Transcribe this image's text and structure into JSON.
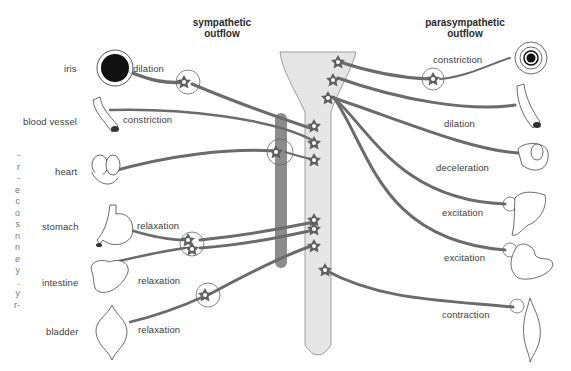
{
  "headers": {
    "sympathetic": [
      "sympathetic",
      "outflow"
    ],
    "parasympathetic": [
      "parasympathetic",
      "outflow"
    ]
  },
  "organs_left": [
    {
      "name": "iris",
      "effect": "dilation"
    },
    {
      "name": "blood vessel",
      "effect": "constriction"
    },
    {
      "name": "heart",
      "effect": ""
    },
    {
      "name": "stomach",
      "effect": "relaxation"
    },
    {
      "name": "intestine",
      "effect": "relaxation"
    },
    {
      "name": "bladder",
      "effect": "relaxation"
    }
  ],
  "effects_right": [
    {
      "organ": "iris",
      "effect": "constriction"
    },
    {
      "organ": "blood vessel",
      "effect": "dilation"
    },
    {
      "organ": "heart",
      "effect": "deceleration"
    },
    {
      "organ": "stomach",
      "effect": "excitation"
    },
    {
      "organ": "intestine",
      "effect": "excitation"
    },
    {
      "organ": "bladder",
      "effect": "contraction"
    }
  ],
  "margin_fragments": [
    "-",
    "r",
    "-",
    "e",
    "c",
    "o",
    "s",
    "n",
    "n",
    "e",
    "y",
    ".",
    "y",
    "r-"
  ],
  "colors": {
    "nerve": "#6b6b6b",
    "spinal_cord_fill": "#e6e6e6",
    "sympathetic_chain": "#8a8a8a",
    "outline": "#555555",
    "iris_pupil": "#111111"
  }
}
